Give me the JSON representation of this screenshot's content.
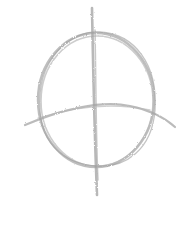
{
  "image": {
    "subject": "pencil sketch of a circle crossed by a vertical and horizontal line",
    "background_color": "#ffffff",
    "stroke_color": "#9a9a9a",
    "stroke_color_light": "#c4c4c4"
  }
}
